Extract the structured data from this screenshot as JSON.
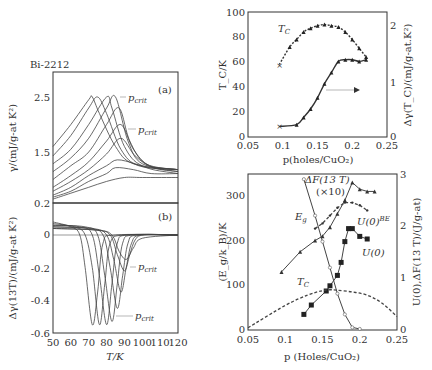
{
  "figure": {
    "sample_label": "Bi-2212"
  },
  "chart_data": [
    {
      "id": "panel-a",
      "type": "line",
      "panel_label": "(a)",
      "title": "Bi-2212",
      "xlabel": "T/K",
      "ylabel": "γ/(mJ/g-at K²)",
      "xlim": [
        50,
        120
      ],
      "ylim": [
        0.2,
        3.0
      ],
      "yticks": [
        0.2,
        1.5,
        2.5
      ],
      "annotations": [
        "p_crit",
        "p_crit"
      ],
      "series": [
        {
          "name": "curve1",
          "x": [
            50,
            60,
            70,
            72,
            76,
            85,
            95,
            120
          ],
          "values": [
            1.6,
            2.0,
            2.45,
            2.5,
            2.2,
            1.6,
            1.2,
            1.05
          ]
        },
        {
          "name": "curve2",
          "x": [
            50,
            60,
            70,
            75,
            80,
            88,
            98,
            120
          ],
          "values": [
            1.4,
            1.8,
            2.3,
            2.5,
            2.2,
            1.55,
            1.15,
            1.05
          ]
        },
        {
          "name": "curve3",
          "x": [
            50,
            60,
            70,
            80,
            83,
            90,
            100,
            120
          ],
          "values": [
            1.2,
            1.55,
            2.0,
            2.5,
            2.3,
            1.6,
            1.15,
            1.05
          ]
        },
        {
          "name": "curve4",
          "x": [
            50,
            60,
            70,
            80,
            85,
            92,
            100,
            120
          ],
          "values": [
            1.0,
            1.35,
            1.75,
            2.3,
            2.5,
            1.7,
            1.2,
            1.05
          ]
        },
        {
          "name": "curve5",
          "x": [
            50,
            60,
            70,
            80,
            87,
            93,
            102,
            120
          ],
          "values": [
            0.8,
            1.15,
            1.5,
            2.0,
            2.3,
            1.7,
            1.2,
            1.05
          ]
        },
        {
          "name": "curve6",
          "x": [
            50,
            60,
            70,
            80,
            88,
            95,
            104,
            120
          ],
          "values": [
            0.6,
            0.9,
            1.25,
            1.7,
            2.0,
            1.55,
            1.15,
            1.0
          ]
        },
        {
          "name": "curve7",
          "x": [
            50,
            60,
            70,
            80,
            88,
            96,
            106,
            120
          ],
          "values": [
            0.5,
            0.75,
            1.05,
            1.45,
            1.75,
            1.4,
            1.1,
            1.0
          ]
        },
        {
          "name": "curve8",
          "x": [
            50,
            60,
            70,
            80,
            86,
            96,
            106,
            120
          ],
          "values": [
            0.4,
            0.6,
            0.9,
            1.15,
            1.3,
            1.2,
            1.05,
            0.95
          ]
        },
        {
          "name": "curve9",
          "x": [
            50,
            60,
            70,
            80,
            85,
            95,
            105,
            120
          ],
          "values": [
            0.35,
            0.5,
            0.75,
            0.95,
            1.1,
            1.05,
            0.95,
            0.95
          ]
        },
        {
          "name": "curve10",
          "x": [
            50,
            60,
            70,
            80,
            90,
            100,
            120
          ],
          "values": [
            0.3,
            0.45,
            0.6,
            0.75,
            0.85,
            0.85,
            0.85
          ]
        }
      ]
    },
    {
      "id": "panel-b",
      "type": "line",
      "panel_label": "(b)",
      "xlabel": "T/K",
      "ylabel": "Δγ(13T)/(mJ/g-at K²)",
      "xlim": [
        50,
        120
      ],
      "ylim": [
        -0.6,
        0.2
      ],
      "xticks": [
        50,
        60,
        70,
        80,
        90,
        100,
        110,
        120
      ],
      "yticks": [
        -0.6,
        -0.4,
        -0.2,
        0,
        0.2
      ],
      "annotations": [
        "p_crit",
        "p_crit"
      ],
      "series": [
        {
          "name": "curve1",
          "x": [
            50,
            60,
            65,
            68,
            72,
            75,
            78,
            85,
            120
          ],
          "values": [
            0.08,
            0.05,
            0,
            -0.2,
            -0.55,
            -0.35,
            -0.05,
            0.0,
            0.0
          ]
        },
        {
          "name": "curve2",
          "x": [
            50,
            62,
            68,
            72,
            76,
            79,
            82,
            90,
            120
          ],
          "values": [
            0.07,
            0.05,
            0,
            -0.2,
            -0.55,
            -0.3,
            -0.05,
            0.0,
            0.0
          ]
        },
        {
          "name": "curve3",
          "x": [
            50,
            65,
            72,
            76,
            80,
            83,
            86,
            92,
            120
          ],
          "values": [
            0.06,
            0.05,
            0,
            -0.25,
            -0.55,
            -0.3,
            -0.05,
            0.0,
            0.0
          ]
        },
        {
          "name": "curve4",
          "x": [
            50,
            68,
            75,
            79,
            83,
            86,
            89,
            95,
            120
          ],
          "values": [
            0.06,
            0.05,
            0,
            -0.25,
            -0.53,
            -0.3,
            -0.05,
            0.0,
            0.0
          ]
        },
        {
          "name": "curve5",
          "x": [
            50,
            70,
            78,
            82,
            86,
            89,
            92,
            97,
            120
          ],
          "values": [
            0.05,
            0.04,
            0,
            -0.2,
            -0.45,
            -0.25,
            -0.05,
            0.0,
            0.0
          ]
        },
        {
          "name": "curve6",
          "x": [
            50,
            72,
            80,
            84,
            88,
            91,
            94,
            99,
            120
          ],
          "values": [
            0.05,
            0.04,
            0,
            -0.15,
            -0.35,
            -0.2,
            -0.05,
            0.0,
            0.0
          ]
        },
        {
          "name": "curve7",
          "x": [
            50,
            74,
            82,
            86,
            90,
            93,
            96,
            101,
            120
          ],
          "values": [
            0.04,
            0.03,
            0,
            -0.12,
            -0.22,
            -0.12,
            -0.03,
            0.0,
            0.0
          ]
        },
        {
          "name": "curve8",
          "x": [
            50,
            75,
            83,
            87,
            91,
            95,
            100,
            120
          ],
          "values": [
            0.04,
            0.03,
            0,
            -0.1,
            -0.15,
            -0.08,
            -0.02,
            0.0
          ]
        }
      ]
    },
    {
      "id": "top-right",
      "type": "scatter",
      "xlabel": "p(holes/CuO₂)",
      "ylabel": "T_C/K",
      "ylabel_right": "Δγ(T_C)/(mJ/g-at.K²)",
      "xlim": [
        0.05,
        0.25
      ],
      "ylim": [
        0,
        100
      ],
      "ylim_right": [
        0,
        2.2
      ],
      "xticks": [
        0.05,
        0.1,
        0.15,
        0.2,
        0.25
      ],
      "yticks": [
        0,
        20,
        40,
        60,
        80,
        100
      ],
      "yticks_right": [
        0,
        1,
        2
      ],
      "annotations": [
        "T_C",
        "arrow → right axis"
      ],
      "series": [
        {
          "name": "T_C",
          "axis": "left",
          "x": [
            0.095,
            0.11,
            0.12,
            0.13,
            0.14,
            0.15,
            0.16,
            0.17,
            0.18,
            0.19,
            0.2,
            0.21,
            0.22
          ],
          "values": [
            58,
            72,
            78,
            84,
            87,
            89,
            90,
            89,
            88,
            84,
            78,
            71,
            64
          ]
        },
        {
          "name": "Δγ(T_C)",
          "axis": "right",
          "x": [
            0.095,
            0.12,
            0.13,
            0.14,
            0.15,
            0.16,
            0.17,
            0.18,
            0.19,
            0.2,
            0.21,
            0.22
          ],
          "values": [
            0.19,
            0.22,
            0.35,
            0.5,
            0.7,
            0.95,
            1.15,
            1.35,
            1.38,
            1.38,
            1.35,
            1.38
          ]
        }
      ]
    },
    {
      "id": "bottom-right",
      "type": "line",
      "xlabel": "p (Holes/CuO₂)",
      "ylabel": "(E_g/k_B)/K",
      "ylabel_right": "U(0),ΔF(13 T)/(J/g-at)",
      "xlim": [
        0.05,
        0.25
      ],
      "ylim": [
        0,
        350
      ],
      "ylim_right": [
        0,
        3
      ],
      "xticks": [
        0.05,
        0.1,
        0.15,
        0.2,
        0.25
      ],
      "yticks": [
        0,
        100,
        200,
        300
      ],
      "yticks_right": [
        0,
        1,
        2,
        3
      ],
      "annotations": [
        "ΔF(13 T) (×10)",
        "E_g",
        "U(0)^BE",
        "U(0)",
        "T_C"
      ],
      "series": [
        {
          "name": "E_g",
          "axis": "left",
          "x": [
            0.095,
            0.12,
            0.14,
            0.15,
            0.16,
            0.17,
            0.18,
            0.19,
            0.2,
            0.21,
            0.22
          ],
          "values": [
            130,
            175,
            200,
            210,
            230,
            260,
            290,
            330,
            315,
            310,
            310
          ]
        },
        {
          "name": "U(0)^BE",
          "axis": "right",
          "x": [
            0.14,
            0.15,
            0.16,
            0.17,
            0.18,
            0.19,
            0.2,
            0.21
          ],
          "values": [
            1.95,
            2.05,
            2.2,
            2.35,
            2.45,
            2.45,
            2.4,
            2.3
          ]
        },
        {
          "name": "U(0)",
          "axis": "right",
          "x": [
            0.125,
            0.135,
            0.155,
            0.16,
            0.17,
            0.175,
            0.18,
            0.185,
            0.19,
            0.2,
            0.21
          ],
          "values": [
            0.3,
            0.48,
            0.75,
            0.85,
            1.05,
            1.3,
            1.7,
            1.95,
            1.95,
            1.8,
            1.75
          ]
        },
        {
          "name": "ΔF(13 T)(×10)",
          "axis": "right",
          "x": [
            0.125,
            0.14,
            0.15,
            0.16,
            0.17,
            0.18,
            0.19,
            0.2
          ],
          "values": [
            2.9,
            2.2,
            1.7,
            1.2,
            0.7,
            0.3,
            0.05,
            0.02
          ]
        },
        {
          "name": "T_C",
          "axis": "left",
          "x": [
            0.05,
            0.1,
            0.13,
            0.15,
            0.16,
            0.17,
            0.19,
            0.21,
            0.23,
            0.25
          ],
          "values": [
            5,
            55,
            78,
            88,
            90,
            89,
            85,
            78,
            60,
            30
          ]
        }
      ]
    }
  ]
}
